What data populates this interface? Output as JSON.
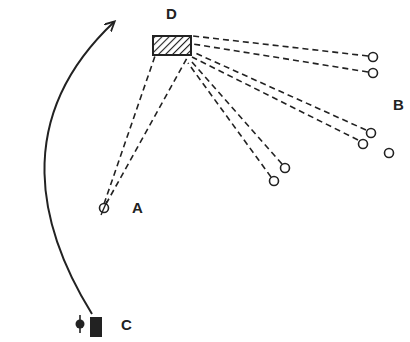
{
  "diagram": {
    "labels": {
      "D": "D",
      "B": "B",
      "A": "A",
      "C": "C"
    },
    "elements": {
      "target_box": {
        "label": "D",
        "fill": "hatched"
      },
      "source_circles_B": 6,
      "extra_circle_B": 1,
      "circle_A": 1,
      "start_marker_C": {
        "pin": "filled-circle-with-stem",
        "block": "filled-rectangle"
      },
      "path_arrow": "curved arrow from C up to top near D"
    },
    "colors": {
      "ink": "#222222",
      "background": "#ffffff"
    }
  }
}
